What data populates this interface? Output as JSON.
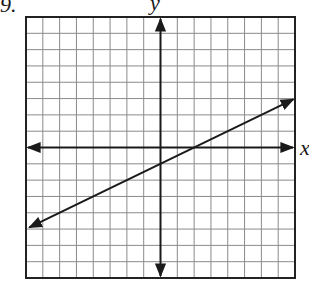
{
  "problem": {
    "number_label": "9."
  },
  "axes": {
    "x_label": "x",
    "y_label": "y"
  },
  "grid": {
    "cols": 16,
    "rows": 16,
    "origin_col": 8,
    "origin_row": 8,
    "left": 26,
    "top": 17,
    "right": 295,
    "bottom": 278,
    "grid_color": "#8a8a8a",
    "axis_color": "#1a1a1a",
    "border_color": "#222222"
  },
  "chart_data": {
    "type": "line",
    "title": "",
    "xlabel": "x",
    "ylabel": "y",
    "xlim": [
      -8,
      8
    ],
    "ylim": [
      -8,
      8
    ],
    "grid": true,
    "tick_labels": false,
    "legend": null,
    "series": [
      {
        "name": "line",
        "equation": "y = 0.5x - 1",
        "slope": 0.5,
        "y_intercept": -1,
        "x_intercept": 2,
        "x": [
          -7.8,
          7.9
        ],
        "y": [
          -4.9,
          2.95
        ],
        "arrows_both_ends": true
      }
    ],
    "annotations": [
      "Problem 9"
    ]
  }
}
